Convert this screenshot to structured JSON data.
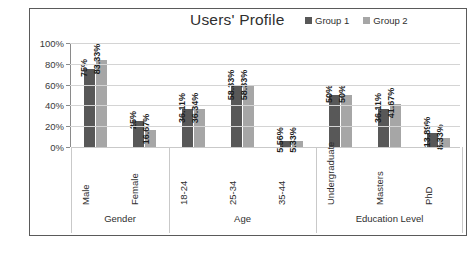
{
  "chart_data": {
    "type": "bar",
    "title": "Users' Profile",
    "xlabel": "",
    "ylabel": "",
    "ylim": [
      0,
      100
    ],
    "ytick_labels": [
      "0%",
      "20%",
      "40%",
      "60%",
      "80%",
      "100%"
    ],
    "ytick_values": [
      0,
      20,
      40,
      60,
      80,
      100
    ],
    "grid": true,
    "legend_position": "top-right",
    "orientation": "vertical",
    "categories": [
      "Male",
      "Female",
      "18-24",
      "25-34",
      "35-44",
      "Undergraduate",
      "Masters",
      "PhD"
    ],
    "series": [
      {
        "name": "Group 1",
        "color": "#585858",
        "values": [
          75,
          25,
          36.11,
          58.33,
          5.56,
          50,
          36.11,
          13.89
        ],
        "labels": [
          "75%",
          "25%",
          "36.11%",
          "58.33%",
          "5.56%",
          "50%",
          "36.11%",
          "13.89%"
        ]
      },
      {
        "name": "Group 2",
        "color": "#a6a6a6",
        "values": [
          83.33,
          16.67,
          36.34,
          58.33,
          5.33,
          50,
          41.67,
          8.33
        ],
        "labels": [
          "83.33%",
          "16.67%",
          "36.34%",
          "58.33%",
          "5.33%",
          "50%",
          "41.67%",
          "8.33%"
        ]
      }
    ],
    "groups": [
      {
        "label": "Gender",
        "categories": [
          "Male",
          "Female"
        ]
      },
      {
        "label": "Age",
        "categories": [
          "18-24",
          "25-34",
          "35-44"
        ]
      },
      {
        "label": "Education Level",
        "categories": [
          "Undergraduate",
          "Masters",
          "PhD"
        ]
      }
    ]
  },
  "legend": {
    "items": [
      {
        "label": "Group 1",
        "color": "#585858"
      },
      {
        "label": "Group 2",
        "color": "#a6a6a6"
      }
    ]
  }
}
